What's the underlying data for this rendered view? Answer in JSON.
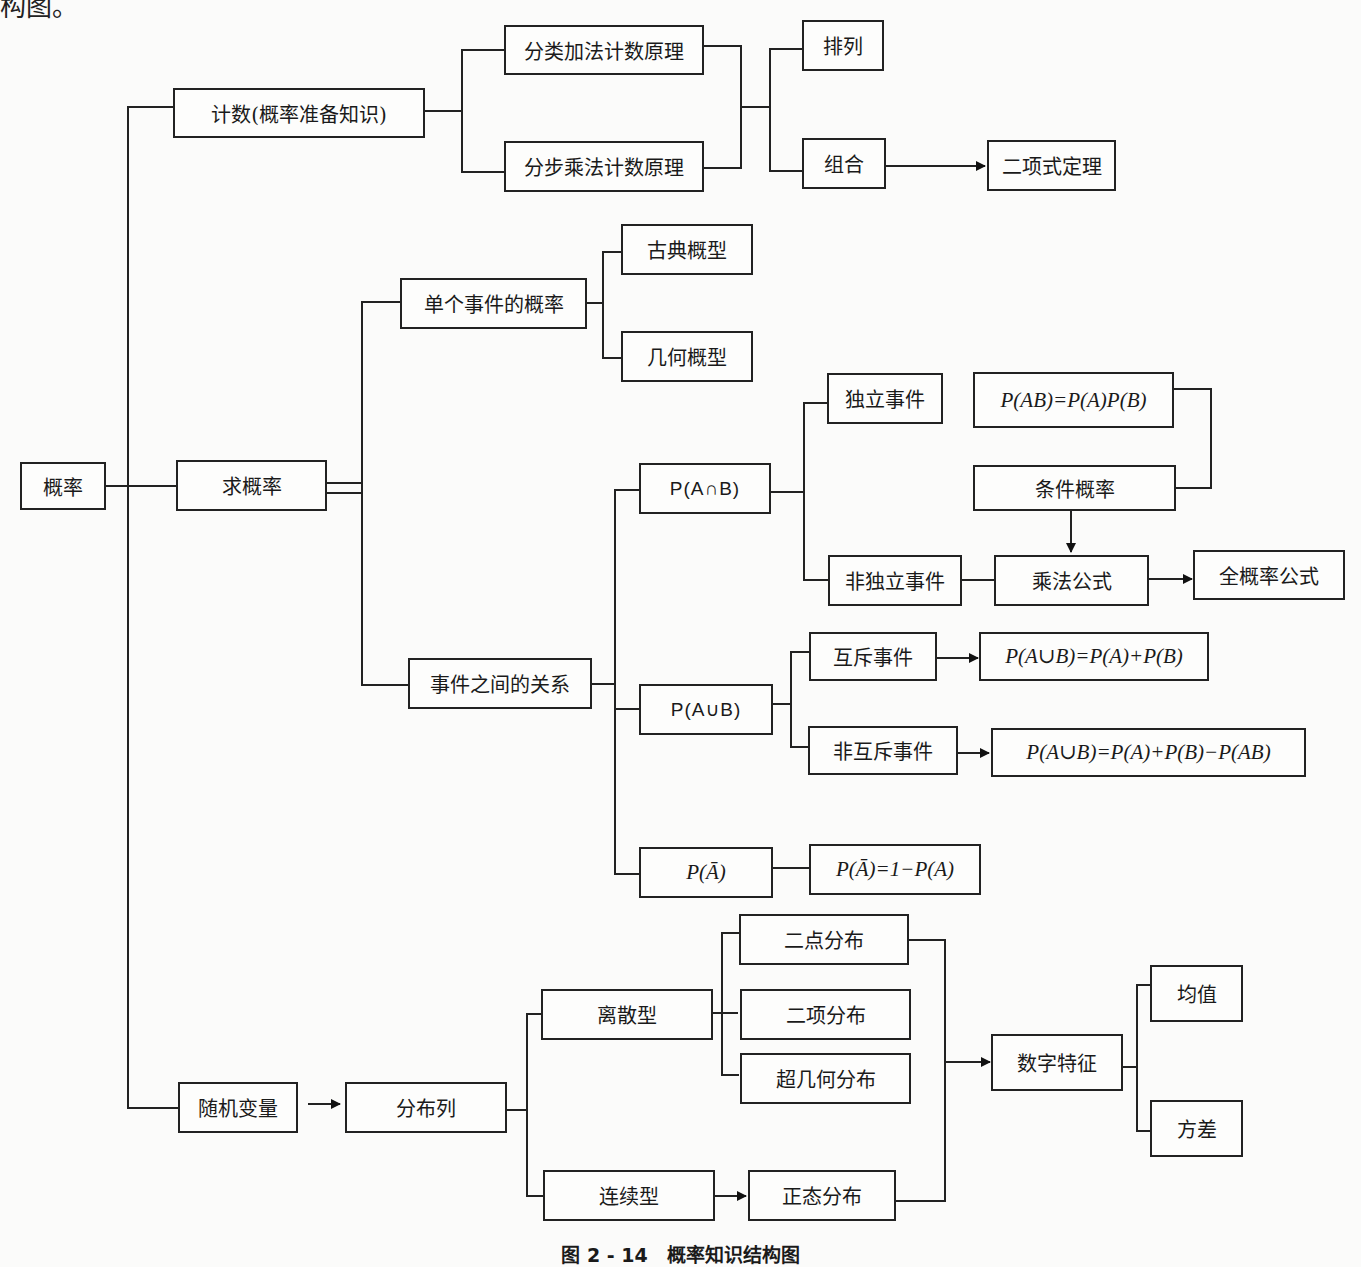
{
  "header_fragment": "构图。",
  "caption": "图 2 - 14　概率知识结构图",
  "nodes": {
    "root": "概率",
    "counting": "计数(概率准备知识)",
    "add_principle": "分类加法计数原理",
    "mul_principle": "分步乘法计数原理",
    "permutation": "排列",
    "combination": "组合",
    "binomial_theorem": "二项式定理",
    "find_prob": "求概率",
    "single_event": "单个事件的概率",
    "classical": "古典概型",
    "geometric": "几何概型",
    "relations": "事件之间的关系",
    "p_and": "P(A∩B)",
    "independent": "独立事件",
    "p_ab_formula": "P(AB)=P(A)P(B)",
    "conditional": "条件概率",
    "dependent": "非独立事件",
    "mult_formula": "乘法公式",
    "total_prob": "全概率公式",
    "p_or": "P(A∪B)",
    "exclusive": "互斥事件",
    "exclusive_formula": "P(A∪B)=P(A)+P(B)",
    "non_exclusive": "非互斥事件",
    "non_exclusive_formula": "P(A∪B)=P(A)+P(B)−P(AB)",
    "p_complement": "P(Ā)",
    "complement_formula": "P(Ā)=1−P(A)",
    "random_var": "随机变量",
    "distribution": "分布列",
    "discrete": "离散型",
    "two_point": "二点分布",
    "binomial": "二项分布",
    "hypergeometric": "超几何分布",
    "continuous": "连续型",
    "normal": "正态分布",
    "numeric_features": "数字特征",
    "mean": "均值",
    "variance": "方差"
  }
}
